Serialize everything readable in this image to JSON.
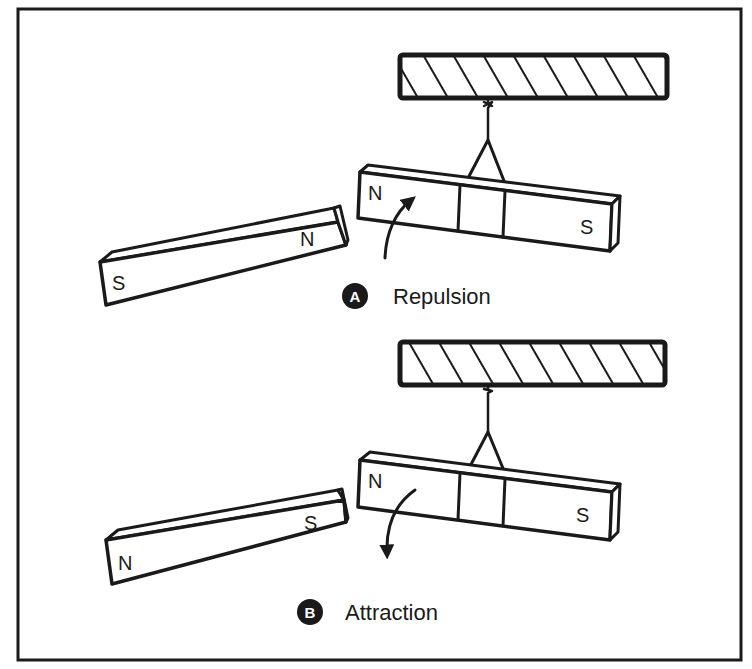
{
  "figure": {
    "colors": {
      "ink": "#1a1a1a",
      "paper": "#ffffff"
    },
    "panels": [
      {
        "id": "A",
        "badge": "A",
        "label": "Repulsion",
        "suspended_magnet": {
          "left_pole": "N",
          "right_pole": "S"
        },
        "free_magnet": {
          "left_pole": "S",
          "right_pole": "N"
        },
        "arrow_direction": "up"
      },
      {
        "id": "B",
        "badge": "B",
        "label": "Attraction",
        "suspended_magnet": {
          "left_pole": "N",
          "right_pole": "S"
        },
        "free_magnet": {
          "left_pole": "N",
          "right_pole": "S"
        },
        "arrow_direction": "down"
      }
    ]
  }
}
